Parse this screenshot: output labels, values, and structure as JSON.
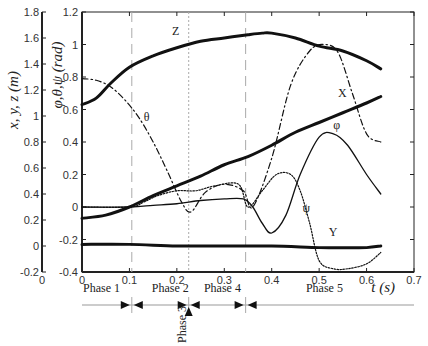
{
  "chart_data": {
    "type": "line",
    "title": "",
    "xlabel": "t (s)",
    "ylabel_left": "x, y, z (m)",
    "ylabel_right_inner": "φ,θ,ψ (rad)",
    "xlim": [
      0,
      0.7
    ],
    "ylim_rad": [
      -0.4,
      1.2
    ],
    "ylim_m": [
      -0.2,
      1.8
    ],
    "x_ticks": [
      "0",
      "0.1",
      "0.2",
      "0.3",
      "0.4",
      "0.5",
      "0.6",
      "0.7"
    ],
    "y_ticks_m": [
      "1.8",
      "1.6",
      "1.4",
      "1.2",
      "1",
      "0.8",
      "0.6",
      "0.4",
      "0.2",
      "0",
      "-0.2"
    ],
    "y_ticks_rad": [
      "1.2",
      "1",
      "0.8",
      "0.6",
      "0.4",
      "0.2",
      "0",
      "-0.2",
      "-0.4"
    ],
    "outer_axis_x_label": "0",
    "grid": false,
    "phase_dividers": [
      0.105,
      0.225,
      0.345
    ],
    "phases": [
      {
        "label": "Phase 1",
        "x": 0.0
      },
      {
        "label": "Phase 2",
        "x": 0.145
      },
      {
        "label": "Phase 3",
        "x": 0.225
      },
      {
        "label": "Phase 4",
        "x": 0.255
      },
      {
        "label": "Phase 5",
        "x": 0.47
      }
    ],
    "series": [
      {
        "name": "Z",
        "style": "solid-thick",
        "x": [
          0,
          0.03,
          0.06,
          0.1,
          0.15,
          0.2,
          0.25,
          0.3,
          0.35,
          0.38,
          0.4,
          0.45,
          0.5,
          0.55,
          0.6,
          0.63
        ],
        "values": [
          0.63,
          0.67,
          0.76,
          0.86,
          0.93,
          0.98,
          1.02,
          1.04,
          1.06,
          1.07,
          1.07,
          1.04,
          0.99,
          0.96,
          0.9,
          0.85
        ]
      },
      {
        "name": "X",
        "style": "solid-thick",
        "x": [
          0,
          0.05,
          0.1,
          0.15,
          0.2,
          0.25,
          0.3,
          0.35,
          0.4,
          0.45,
          0.5,
          0.55,
          0.6,
          0.63
        ],
        "values": [
          -0.07,
          -0.05,
          0.0,
          0.07,
          0.13,
          0.19,
          0.26,
          0.31,
          0.38,
          0.46,
          0.52,
          0.58,
          0.64,
          0.68
        ]
      },
      {
        "name": "θ",
        "style": "dash-dot",
        "x": [
          0,
          0.03,
          0.06,
          0.09,
          0.12,
          0.15,
          0.18,
          0.21,
          0.23,
          0.26,
          0.3,
          0.34,
          0.36,
          0.4,
          0.44,
          0.48,
          0.51,
          0.54,
          0.57,
          0.6,
          0.63
        ],
        "values": [
          0.79,
          0.78,
          0.74,
          0.66,
          0.55,
          0.4,
          0.22,
          0.03,
          -0.03,
          0.09,
          0.14,
          0.1,
          0.0,
          0.3,
          0.75,
          0.96,
          1.0,
          0.95,
          0.7,
          0.45,
          0.4
        ]
      },
      {
        "name": "φ",
        "style": "solid-thin",
        "x": [
          0,
          0.1,
          0.15,
          0.2,
          0.25,
          0.3,
          0.34,
          0.36,
          0.38,
          0.4,
          0.43,
          0.46,
          0.5,
          0.53,
          0.56,
          0.6,
          0.63
        ],
        "values": [
          0.0,
          0.0,
          0.01,
          0.02,
          0.04,
          0.05,
          0.05,
          0.0,
          -0.1,
          -0.16,
          -0.05,
          0.2,
          0.43,
          0.45,
          0.38,
          0.2,
          0.08
        ]
      },
      {
        "name": "ψ",
        "style": "dotted",
        "x": [
          0,
          0.1,
          0.13,
          0.16,
          0.2,
          0.24,
          0.28,
          0.33,
          0.35,
          0.38,
          0.41,
          0.44,
          0.46,
          0.48,
          0.5,
          0.53,
          0.56,
          0.6,
          0.63
        ],
        "values": [
          0.0,
          0.0,
          0.03,
          0.07,
          0.1,
          0.1,
          0.13,
          0.14,
          0.0,
          0.1,
          0.2,
          0.2,
          0.1,
          -0.1,
          -0.33,
          -0.38,
          -0.38,
          -0.35,
          -0.28
        ]
      },
      {
        "name": "Y",
        "style": "solid-thick",
        "x": [
          0,
          0.1,
          0.2,
          0.3,
          0.4,
          0.5,
          0.55,
          0.6,
          0.63
        ],
        "values": [
          -0.23,
          -0.23,
          -0.24,
          -0.24,
          -0.24,
          -0.25,
          -0.25,
          -0.25,
          -0.24
        ]
      }
    ],
    "curve_labels": [
      {
        "text": "Z",
        "x": 0.19,
        "y": 1.06
      },
      {
        "text": "θ",
        "x": 0.13,
        "y": 0.53
      },
      {
        "text": "X",
        "x": 0.54,
        "y": 0.68
      },
      {
        "text": "φ",
        "x": 0.53,
        "y": 0.48
      },
      {
        "text": "ψ",
        "x": 0.465,
        "y": -0.03
      },
      {
        "text": "Y",
        "x": 0.52,
        "y": -0.18
      }
    ]
  }
}
